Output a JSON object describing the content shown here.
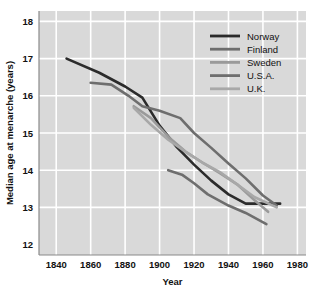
{
  "chart_data": {
    "type": "line",
    "title": "",
    "xlabel": "Year",
    "ylabel": "Median age at menarche (years)",
    "xlim": [
      1830,
      1985
    ],
    "ylim": [
      11.72,
      18.28
    ],
    "xticks": [
      1840,
      1860,
      1880,
      1900,
      1920,
      1940,
      1960,
      1980
    ],
    "yticks": [
      12,
      13,
      14,
      15,
      16,
      17,
      18
    ],
    "grid": true,
    "legend_position": "top-right",
    "plot_background": "#d9d9d9",
    "grid_color": "#ffffff",
    "axis_color": "#8a8a8a",
    "series": [
      {
        "name": "Norway",
        "color": "#2b2b2b",
        "width": 2.6,
        "points": [
          [
            1846,
            17.0
          ],
          [
            1865,
            16.62
          ],
          [
            1880,
            16.25
          ],
          [
            1890,
            15.95
          ],
          [
            1900,
            15.2
          ],
          [
            1910,
            14.62
          ],
          [
            1920,
            14.15
          ],
          [
            1930,
            13.72
          ],
          [
            1940,
            13.35
          ],
          [
            1950,
            13.1
          ],
          [
            1970,
            13.1
          ]
        ]
      },
      {
        "name": "Finland",
        "color": "#6e6e6e",
        "width": 2.6,
        "points": [
          [
            1860,
            16.35
          ],
          [
            1872,
            16.3
          ],
          [
            1882,
            16.0
          ],
          [
            1890,
            15.72
          ],
          [
            1900,
            15.6
          ],
          [
            1912,
            15.4
          ],
          [
            1920,
            15.0
          ],
          [
            1930,
            14.6
          ],
          [
            1940,
            14.18
          ],
          [
            1950,
            13.78
          ],
          [
            1960,
            13.32
          ],
          [
            1968,
            13.05
          ]
        ]
      },
      {
        "name": "Sweden",
        "color": "#9a9a9a",
        "width": 2.6,
        "points": [
          [
            1885,
            15.72
          ],
          [
            1895,
            15.4
          ],
          [
            1905,
            14.9
          ],
          [
            1915,
            14.5
          ],
          [
            1925,
            14.2
          ],
          [
            1935,
            13.92
          ],
          [
            1945,
            13.62
          ],
          [
            1955,
            13.2
          ],
          [
            1963,
            12.88
          ]
        ]
      },
      {
        "name": "U.S.A.",
        "color": "#6e6e6e",
        "width": 2.6,
        "points": [
          [
            1905,
            14.0
          ],
          [
            1913,
            13.88
          ],
          [
            1920,
            13.65
          ],
          [
            1928,
            13.35
          ],
          [
            1940,
            13.05
          ],
          [
            1950,
            12.85
          ],
          [
            1962,
            12.55
          ]
        ]
      },
      {
        "name": "U.K.",
        "color": "#a8a8a8",
        "width": 2.6,
        "points": [
          [
            1885,
            15.68
          ],
          [
            1895,
            15.22
          ],
          [
            1905,
            14.82
          ],
          [
            1915,
            14.5
          ],
          [
            1925,
            14.2
          ],
          [
            1935,
            13.95
          ],
          [
            1945,
            13.62
          ],
          [
            1955,
            13.28
          ],
          [
            1968,
            13.0
          ]
        ]
      }
    ]
  },
  "legend": {
    "entries": [
      {
        "label": "Norway",
        "color": "#2b2b2b"
      },
      {
        "label": "Finland",
        "color": "#6e6e6e"
      },
      {
        "label": "Sweden",
        "color": "#9a9a9a"
      },
      {
        "label": "U.S.A.",
        "color": "#6e6e6e"
      },
      {
        "label": "U.K.",
        "color": "#a8a8a8"
      }
    ]
  }
}
